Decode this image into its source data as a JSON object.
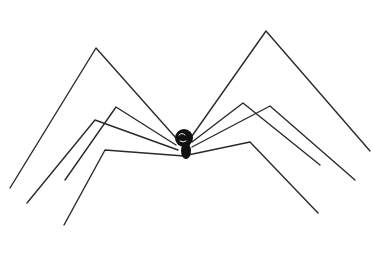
{
  "image": {
    "description": "Hand-drawn line sketch of a long-legged spider (daddy long-legs) on white background",
    "background": "#ffffff",
    "stroke_color": "#2a2a2a",
    "body_color": "#111111"
  },
  "spider": {
    "body": {
      "cx": 184,
      "cy": 142,
      "rx": 9,
      "ry": 11
    },
    "left_legs": [
      {
        "points": "10,188 96,48 176,138"
      },
      {
        "points": "65,180 116,107 176,145"
      },
      {
        "points": "27,203 95,120 178,150"
      },
      {
        "points": "64,225 105,150 184,156"
      }
    ],
    "right_legs": [
      {
        "points": "370,151 266,31 192,136"
      },
      {
        "points": "320,165 243,103 192,142"
      },
      {
        "points": "355,180 270,106 192,147"
      },
      {
        "points": "318,213 250,142 188,155"
      }
    ]
  },
  "caption": "spider drawing"
}
